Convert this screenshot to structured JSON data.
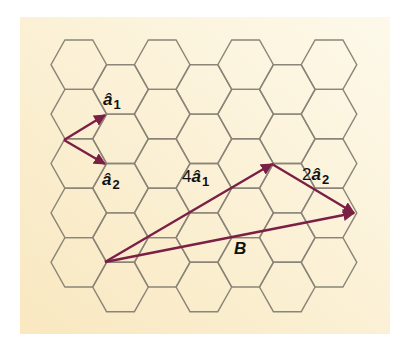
{
  "diagram": {
    "type": "honeycomb-lattice-vectors",
    "background": {
      "x": 20,
      "y": 17,
      "width": 370,
      "height": 317,
      "color_top": "#fdf9ea",
      "color_bottom": "#f9e9c2"
    },
    "lattice": {
      "columns": 7,
      "rows": 5,
      "origin_x": 51,
      "origin_y": 40,
      "side": 27.8,
      "col_step": 41.7,
      "half_height": 24.7,
      "line_color": "#8a8578"
    },
    "arrow_color": "#7b1f45",
    "vectors": [
      {
        "name": "a1-unit",
        "from": [
          64,
          140
        ],
        "to": [
          105,
          115
        ]
      },
      {
        "name": "a2-unit",
        "from": [
          64,
          140
        ],
        "to": [
          105,
          164
        ]
      },
      {
        "name": "4a1",
        "from": [
          105,
          262
        ],
        "to": [
          272,
          164
        ]
      },
      {
        "name": "2a2",
        "from": [
          272,
          164
        ],
        "to": [
          354,
          213
        ]
      },
      {
        "name": "B",
        "from": [
          105,
          262
        ],
        "to": [
          354,
          213
        ]
      }
    ],
    "labels": {
      "a1": {
        "coef": "",
        "main": "â",
        "sub": "1",
        "x": 103,
        "y": 91
      },
      "a2": {
        "coef": "",
        "main": "â",
        "sub": "2",
        "x": 102,
        "y": 171
      },
      "four_a1": {
        "coef": "4",
        "main": "â",
        "sub": "1",
        "x": 182,
        "y": 168
      },
      "two_a2": {
        "coef": "2",
        "main": "â",
        "sub": "2",
        "x": 302,
        "y": 166
      },
      "B": {
        "coef": "",
        "main": "B",
        "sub": "",
        "x": 234,
        "y": 240
      }
    }
  }
}
